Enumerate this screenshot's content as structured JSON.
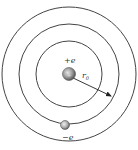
{
  "diagram": {
    "nucleus": {
      "label": "+e",
      "center": [
        69,
        74
      ],
      "radius": 6.5
    },
    "orbits": [
      {
        "name": "inner",
        "radius": 33
      },
      {
        "name": "middle",
        "radius": 50
      },
      {
        "name": "outer",
        "radius": 67
      }
    ],
    "radius_label": {
      "symbol": "r",
      "subscript": "0"
    },
    "electron": {
      "label": "−e",
      "center": [
        65,
        125
      ],
      "radius": 4.5
    },
    "colors": {
      "line": "#444444",
      "nucleus_fill": "#9a9a9a",
      "electron_fill": "#b0b0b0",
      "text": "#333333"
    }
  }
}
